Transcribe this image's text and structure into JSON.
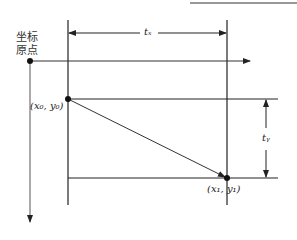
{
  "diagram": {
    "origin_label_line1": "坐标",
    "origin_label_line2": "原点",
    "start_point_label": "(x₀, y₀)",
    "end_point_label": "(x₁, y₁)",
    "tx_label": "tₓ",
    "ty_label": "tᵧ",
    "colors": {
      "line": "#222222",
      "axis": "#555555"
    }
  }
}
